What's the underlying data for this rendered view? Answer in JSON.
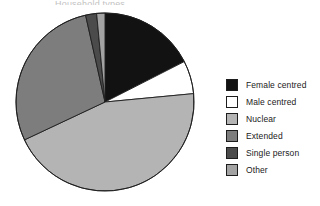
{
  "title": {
    "text": "Household types",
    "note": "top of title cropped off by screenshot frame"
  },
  "chart_data": {
    "type": "pie",
    "title": "Household types",
    "xlabel": "",
    "ylabel": "",
    "grid": false,
    "legend_position": "right",
    "start_angle_deg": 0,
    "direction": "clockwise",
    "categories": [
      "Female centred",
      "Male centred",
      "Nuclear",
      "Extended",
      "Single person",
      "Other"
    ],
    "values": [
      17.5,
      6.0,
      44.5,
      28.5,
      2.0,
      1.5
    ],
    "units": "percent",
    "colors": [
      "#121212",
      "#ffffff",
      "#b4b4b4",
      "#7d7d7d",
      "#4b4b4b",
      "#a3a3a3"
    ],
    "slices": [
      {
        "label": "Female centred",
        "value": 17.5,
        "color": "#121212",
        "start_deg": 0.0,
        "end_deg": 63.0
      },
      {
        "label": "Male centred",
        "value": 6.0,
        "color": "#ffffff",
        "start_deg": 63.0,
        "end_deg": 84.6
      },
      {
        "label": "Nuclear",
        "value": 44.5,
        "color": "#b4b4b4",
        "start_deg": 84.6,
        "end_deg": 244.8
      },
      {
        "label": "Extended",
        "value": 28.5,
        "color": "#7d7d7d",
        "start_deg": 244.8,
        "end_deg": 347.4
      },
      {
        "label": "Single person",
        "value": 2.0,
        "color": "#4b4b4b",
        "start_deg": 347.4,
        "end_deg": 354.6
      },
      {
        "label": "Other",
        "value": 1.5,
        "color": "#a3a3a3",
        "start_deg": 354.6,
        "end_deg": 360.0
      }
    ],
    "geometry": {
      "cx": 90,
      "cy": 90,
      "r": 89,
      "stroke": "#1d1d1d",
      "stroke_width": 0.9
    }
  },
  "legend": {
    "items": [
      {
        "label": "Female centred",
        "color": "#121212"
      },
      {
        "label": "Male centred",
        "color": "#ffffff"
      },
      {
        "label": "Nuclear",
        "color": "#b4b4b4"
      },
      {
        "label": "Extended",
        "color": "#7d7d7d"
      },
      {
        "label": "Single person",
        "color": "#4b4b4b"
      },
      {
        "label": "Other",
        "color": "#a3a3a3"
      }
    ]
  }
}
